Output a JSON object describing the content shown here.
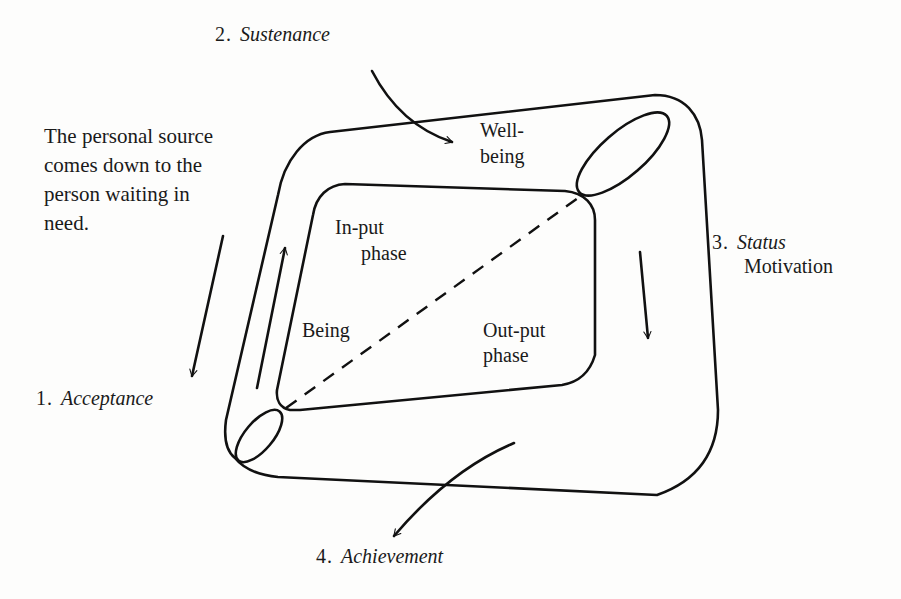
{
  "diagram": {
    "stages": [
      {
        "number": "1.",
        "name": "Acceptance"
      },
      {
        "number": "2.",
        "name": "Sustenance"
      },
      {
        "number": "3.",
        "name": "Status",
        "subtitle": "Motivation"
      },
      {
        "number": "4.",
        "name": "Achievement"
      }
    ],
    "annotation": {
      "lines": [
        "The personal source",
        "comes down to the",
        "person waiting in",
        "need."
      ]
    },
    "regions": {
      "wellbeing": [
        "Well-",
        "being"
      ],
      "input_phase": [
        "In-put",
        "phase"
      ],
      "being": "Being",
      "output_phase": [
        "Out-put",
        "phase"
      ]
    },
    "colors": {
      "ink": "#111111",
      "paper": "#fdfdfc"
    }
  }
}
